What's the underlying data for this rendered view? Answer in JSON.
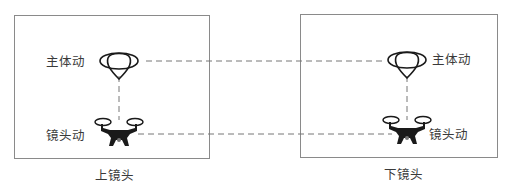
{
  "diagram": {
    "panels": [
      {
        "caption": "上镜头",
        "subject_label": "主体动",
        "camera_label": "镜头动"
      },
      {
        "caption": "下镜头",
        "subject_label": "主体动",
        "camera_label": "镜头动"
      }
    ],
    "icons": {
      "subject": "balloon-icon",
      "camera": "drone-icon"
    },
    "colors": {
      "frame": "#8a8a8a",
      "dash": "#777777",
      "icon": "#1a1a1a",
      "text": "#3a3a3a"
    }
  }
}
